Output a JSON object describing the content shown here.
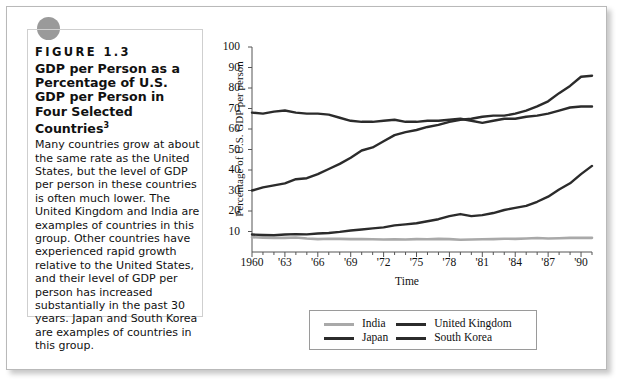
{
  "caption": {
    "figure_label": "FIGURE 1.3",
    "title": "GDP per Person as a Percentage of U.S. GDP per Person in Four Selected Countries",
    "title_superscript": "3",
    "body": "Many countries grow at about the same rate as the United States, but the level of GDP per person in these countries is often much lower. The United Kingdom and India are examples of countries in this group. Other countries have experienced rapid growth relative to the United States, and their level of GDP per person has increased substantially in the past 30 years. Japan and South Korea are examples of countries in this group."
  },
  "colors": {
    "india": "#a9a9a9",
    "united_kingdom": "#2b2b2b",
    "japan": "#2b2b2b",
    "south_korea": "#2b2b2b",
    "frame": "#555555",
    "dot": "#9a9a9a"
  },
  "chart_data": {
    "type": "line",
    "title": "GDP per Person as a Percentage of U.S. GDP per Person in Four Selected Countries",
    "xlabel": "Time",
    "ylabel": "Percentage of U.S. GDP per person",
    "xlim": [
      1960,
      1991
    ],
    "ylim": [
      0,
      100
    ],
    "yticks": [
      100,
      90,
      80,
      70,
      60,
      50,
      40,
      30,
      20,
      10
    ],
    "xticks": [
      1960,
      1963,
      1966,
      1969,
      1972,
      1975,
      1978,
      1981,
      1984,
      1987,
      1990
    ],
    "xtick_labels": [
      "1960",
      "'63",
      "'66",
      "'69",
      "'72",
      "'75",
      "'78",
      "'81",
      "'84",
      "'87",
      "'90"
    ],
    "grid": false,
    "legend_position": "bottom",
    "x": [
      1960,
      1961,
      1962,
      1963,
      1964,
      1965,
      1966,
      1967,
      1968,
      1969,
      1970,
      1971,
      1972,
      1973,
      1974,
      1975,
      1976,
      1977,
      1978,
      1979,
      1980,
      1981,
      1982,
      1983,
      1984,
      1985,
      1986,
      1987,
      1988,
      1989,
      1990,
      1991
    ],
    "series": [
      {
        "name": "India",
        "color": "#a9a9a9",
        "values": [
          7.2,
          7.0,
          6.8,
          6.9,
          7.1,
          6.6,
          6.3,
          6.5,
          6.4,
          6.3,
          6.3,
          6.2,
          6.1,
          6.2,
          6.1,
          6.3,
          6.2,
          6.4,
          6.3,
          6.0,
          6.1,
          6.2,
          6.3,
          6.5,
          6.4,
          6.6,
          6.8,
          6.6,
          6.7,
          6.9,
          6.9,
          6.9
        ]
      },
      {
        "name": "Japan",
        "color": "#2b2b2b",
        "values": [
          30.0,
          31.5,
          32.5,
          33.5,
          35.5,
          36.0,
          38.0,
          40.5,
          43.0,
          46.0,
          49.5,
          51.0,
          54.0,
          57.0,
          58.5,
          59.5,
          61.0,
          62.0,
          63.5,
          64.5,
          65.0,
          66.0,
          66.5,
          66.5,
          67.5,
          69.0,
          71.0,
          73.5,
          77.5,
          81.0,
          85.5,
          86.0
        ]
      },
      {
        "name": "United Kingdom",
        "color": "#2b2b2b",
        "values": [
          68.0,
          67.5,
          68.5,
          69.0,
          68.0,
          67.5,
          67.5,
          67.0,
          65.5,
          64.0,
          63.5,
          63.5,
          64.0,
          64.5,
          63.5,
          63.5,
          64.0,
          64.0,
          64.5,
          65.0,
          64.0,
          63.0,
          64.0,
          65.0,
          65.0,
          66.0,
          66.5,
          67.5,
          69.0,
          70.5,
          71.0,
          71.0
        ]
      },
      {
        "name": "South Korea",
        "color": "#2b2b2b",
        "values": [
          8.5,
          8.3,
          8.2,
          8.5,
          8.7,
          8.6,
          9.0,
          9.3,
          9.8,
          10.5,
          11.0,
          11.5,
          12.0,
          13.0,
          13.5,
          14.0,
          15.0,
          16.0,
          17.5,
          18.5,
          17.5,
          18.0,
          19.0,
          20.5,
          21.5,
          22.5,
          24.5,
          27.0,
          30.5,
          33.5,
          38.0,
          42.0
        ]
      }
    ]
  },
  "legend": {
    "entries": [
      {
        "label": "India",
        "color": "#a9a9a9"
      },
      {
        "label": "United Kingdom",
        "color": "#2b2b2b"
      },
      {
        "label": "Japan",
        "color": "#2b2b2b"
      },
      {
        "label": "South Korea",
        "color": "#2b2b2b"
      }
    ]
  }
}
